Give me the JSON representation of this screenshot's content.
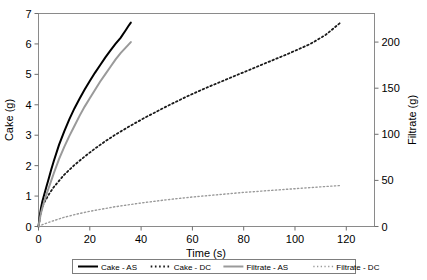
{
  "chart_data": {
    "type": "line",
    "title": "",
    "xlabel": "Time (s)",
    "ylabel": "Cake (g)",
    "y2label": "Filtrate (g)",
    "xlim": [
      0,
      131
    ],
    "ylim": [
      0,
      7
    ],
    "y2lim": [
      0,
      231
    ],
    "grid": false,
    "legend_position": "bottom",
    "xticks": [
      0,
      20,
      40,
      60,
      80,
      100,
      120
    ],
    "xticklabels": [
      "0",
      "20",
      "40",
      "60",
      "80",
      "100",
      "120"
    ],
    "yticks": [
      0,
      1,
      2,
      3,
      4,
      5,
      6,
      7
    ],
    "yticklabels": [
      "0",
      "1",
      "2",
      "3",
      "4",
      "5",
      "6",
      "7"
    ],
    "y2ticks": [
      0,
      50,
      100,
      150,
      200
    ],
    "y2ticklabels": [
      "0",
      "50",
      "100",
      "150",
      "200"
    ],
    "series": [
      {
        "name": "Cake - AS",
        "axis": "left",
        "style": "solid",
        "color": "#000000",
        "x": [
          0,
          0.5,
          1,
          1.5,
          2,
          3,
          4,
          5,
          6,
          8,
          10,
          12,
          14,
          16,
          18,
          20,
          22,
          24,
          26,
          28,
          30,
          32,
          34,
          35,
          36
        ],
        "y": [
          0.0,
          0.35,
          0.62,
          0.82,
          0.98,
          1.28,
          1.58,
          1.88,
          2.16,
          2.68,
          3.12,
          3.52,
          3.88,
          4.2,
          4.5,
          4.78,
          5.05,
          5.3,
          5.55,
          5.78,
          6.0,
          6.2,
          6.45,
          6.58,
          6.7
        ]
      },
      {
        "name": "Cake - DC",
        "axis": "left",
        "style": "dotted",
        "color": "#1a1a1a",
        "x": [
          0,
          1,
          2,
          4,
          6,
          8,
          10,
          14,
          18,
          22,
          26,
          30,
          36,
          42,
          50,
          58,
          66,
          74,
          82,
          90,
          98,
          106,
          112,
          118
        ],
        "y": [
          0.0,
          0.5,
          0.75,
          1.05,
          1.3,
          1.5,
          1.7,
          2.02,
          2.3,
          2.56,
          2.8,
          3.02,
          3.32,
          3.6,
          3.95,
          4.28,
          4.58,
          4.86,
          5.14,
          5.42,
          5.7,
          6.0,
          6.3,
          6.72
        ]
      },
      {
        "name": "Filtrate - AS",
        "axis": "right",
        "style": "solid",
        "color": "#9a9a9a",
        "x": [
          0,
          0.5,
          1,
          1.5,
          2,
          3,
          4,
          5,
          6,
          8,
          10,
          12,
          14,
          16,
          18,
          20,
          22,
          24,
          26,
          28,
          30,
          32,
          34,
          35,
          36
        ],
        "y": [
          0,
          8,
          15,
          20,
          25,
          34,
          42,
          50,
          58,
          73,
          86,
          98,
          109,
          120,
          130,
          139,
          148,
          157,
          165,
          173,
          181,
          188,
          194,
          197,
          200
        ]
      },
      {
        "name": "Filtrate - DC",
        "axis": "right",
        "style": "dotted",
        "color": "#9a9a9a",
        "x": [
          0,
          2,
          5,
          10,
          15,
          20,
          25,
          30,
          40,
          50,
          60,
          70,
          80,
          90,
          100,
          110,
          118
        ],
        "y": [
          0,
          2.5,
          5.5,
          10.0,
          13.5,
          16.5,
          19.0,
          21.5,
          25.5,
          29.0,
          32.0,
          34.5,
          37.0,
          39.0,
          41.0,
          43.0,
          44.5
        ]
      }
    ]
  },
  "legend": {
    "items": [
      {
        "label": "Cake - AS",
        "style": "solid-black"
      },
      {
        "label": "Cake - DC",
        "style": "dotted-black"
      },
      {
        "label": "Filtrate - AS",
        "style": "solid-gray"
      },
      {
        "label": "Filtrate - DC",
        "style": "dotted-gray"
      }
    ]
  },
  "axes": {
    "x_title": "Time (s)",
    "y_left_title": "Cake (g)",
    "y_right_title": "Filtrate (g)"
  },
  "colors": {
    "cake_as": "#000000",
    "cake_dc": "#1a1a1a",
    "filtrate_as": "#9a9a9a",
    "filtrate_dc": "#9a9a9a",
    "frame": "#8a8a8a",
    "background": "#ffffff"
  }
}
